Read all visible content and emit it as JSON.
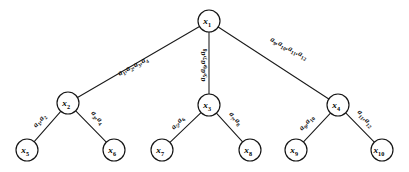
{
  "figure": {
    "type": "tree-diagram",
    "title": "",
    "background_color": "#ffffff",
    "stroke_color": "#141414",
    "node_fill_color": "#ffffff",
    "text_color": "#000000"
  },
  "nodes": [
    {
      "id": "x1",
      "base": "x",
      "sub": "1",
      "label": "x1",
      "cx": 209,
      "cy": 21,
      "r": 11,
      "level": "root"
    },
    {
      "id": "x2",
      "base": "x",
      "sub": "2",
      "label": "x2",
      "cx": 68,
      "cy": 103,
      "r": 11,
      "level": "internal"
    },
    {
      "id": "x3",
      "base": "x",
      "sub": "3",
      "label": "x3",
      "cx": 209,
      "cy": 105,
      "r": 11,
      "level": "internal"
    },
    {
      "id": "x4",
      "base": "x",
      "sub": "4",
      "label": "x4",
      "cx": 338,
      "cy": 105,
      "r": 11,
      "level": "internal"
    },
    {
      "id": "x5",
      "base": "x",
      "sub": "5",
      "label": "x5",
      "cx": 27,
      "cy": 150,
      "r": 11,
      "level": "leaf"
    },
    {
      "id": "x6",
      "base": "x",
      "sub": "6",
      "label": "x6",
      "cx": 114,
      "cy": 150,
      "r": 11,
      "level": "leaf"
    },
    {
      "id": "x7",
      "base": "x",
      "sub": "7",
      "label": "x7",
      "cx": 162,
      "cy": 150,
      "r": 11,
      "level": "leaf"
    },
    {
      "id": "x8",
      "base": "x",
      "sub": "8",
      "label": "x8",
      "cx": 250,
      "cy": 150,
      "r": 11,
      "level": "leaf"
    },
    {
      "id": "x9",
      "base": "x",
      "sub": "9",
      "label": "x9",
      "cx": 296,
      "cy": 150,
      "r": 11,
      "level": "leaf"
    },
    {
      "id": "x10",
      "base": "x",
      "sub": "10",
      "label": "x10",
      "cx": 382,
      "cy": 150,
      "r": 11,
      "level": "leaf"
    }
  ],
  "edges": [
    {
      "id": "edge-x1-x2",
      "from": "x1",
      "to": "x2",
      "label_text": "a1,a2,a3,a4",
      "label_tokens": [
        {
          "base": "a",
          "sub": "1"
        },
        {
          "base": "a",
          "sub": "2"
        },
        {
          "base": "a",
          "sub": "3"
        },
        {
          "base": "a",
          "sub": "4"
        }
      ],
      "label_x": 134,
      "label_y": 68,
      "label_rotation": -28
    },
    {
      "id": "edge-x1-x3",
      "from": "x1",
      "to": "x3",
      "label_text": "a5,a6,a7,a8",
      "label_tokens": [
        {
          "base": "a",
          "sub": "5"
        },
        {
          "base": "a",
          "sub": "6"
        },
        {
          "base": "a",
          "sub": "7"
        },
        {
          "base": "a",
          "sub": "8"
        }
      ],
      "label_x": 205,
      "label_y": 65,
      "label_rotation": -90
    },
    {
      "id": "edge-x1-x4",
      "from": "x1",
      "to": "x4",
      "label_text": "a9,a10,a11,a12",
      "label_tokens": [
        {
          "base": "a",
          "sub": "9"
        },
        {
          "base": "a",
          "sub": "10"
        },
        {
          "base": "a",
          "sub": "11"
        },
        {
          "base": "a",
          "sub": "12"
        }
      ],
      "label_x": 288,
      "label_y": 50,
      "label_rotation": 27
    },
    {
      "id": "edge-x2-x5",
      "from": "x2",
      "to": "x5",
      "label_text": "a1,a2",
      "label_tokens": [
        {
          "base": "a",
          "sub": "1"
        },
        {
          "base": "a",
          "sub": "2"
        }
      ],
      "label_x": 41,
      "label_y": 122,
      "label_rotation": -48
    },
    {
      "id": "edge-x2-x6",
      "from": "x2",
      "to": "x6",
      "label_text": "a3,a4",
      "label_tokens": [
        {
          "base": "a",
          "sub": "3"
        },
        {
          "base": "a",
          "sub": "4"
        }
      ],
      "label_x": 96,
      "label_y": 119,
      "label_rotation": 48
    },
    {
      "id": "edge-x3-x7",
      "from": "x3",
      "to": "x7",
      "label_text": "a5,a6",
      "label_tokens": [
        {
          "base": "a",
          "sub": "5"
        },
        {
          "base": "a",
          "sub": "6"
        }
      ],
      "label_x": 179,
      "label_y": 124,
      "label_rotation": -48
    },
    {
      "id": "edge-x3-x8",
      "from": "x3",
      "to": "x8",
      "label_text": "a7,a8",
      "label_tokens": [
        {
          "base": "a",
          "sub": "7"
        },
        {
          "base": "a",
          "sub": "8"
        }
      ],
      "label_x": 234,
      "label_y": 120,
      "label_rotation": 48
    },
    {
      "id": "edge-x4-x9",
      "from": "x4",
      "to": "x9",
      "label_text": "a9,a10",
      "label_tokens": [
        {
          "base": "a",
          "sub": "9"
        },
        {
          "base": "a",
          "sub": "10"
        }
      ],
      "label_x": 308,
      "label_y": 124,
      "label_rotation": -48
    },
    {
      "id": "edge-x4-x10",
      "from": "x4",
      "to": "x10",
      "label_text": "a11,a12",
      "label_tokens": [
        {
          "base": "a",
          "sub": "11"
        },
        {
          "base": "a",
          "sub": "12"
        }
      ],
      "label_x": 364,
      "label_y": 120,
      "label_rotation": 48
    }
  ]
}
